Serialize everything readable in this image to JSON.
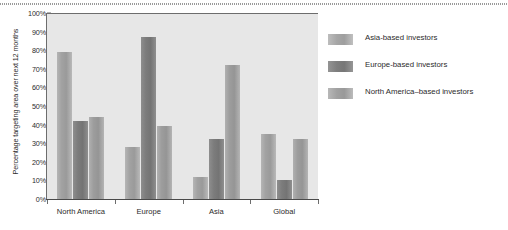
{
  "chart_data": {
    "type": "bar",
    "title": "",
    "subtitle": "",
    "xlabel": "",
    "ylabel": "Percentage targeting area over next 12 months",
    "categories": [
      "North America",
      "Europe",
      "Asia",
      "Global"
    ],
    "series": [
      {
        "name": "Asia-based investors",
        "color": "#a2a2a2",
        "values": [
          79,
          28,
          12,
          35
        ]
      },
      {
        "name": "Europe-based investors",
        "color": "#7c7c7c",
        "values": [
          42,
          87,
          32,
          10
        ]
      },
      {
        "name": "North America–based investors",
        "color": "#9d9d9d",
        "values": [
          44,
          39,
          72,
          32
        ]
      }
    ],
    "ylim": [
      0,
      100
    ],
    "ytick_labels": [
      "0%",
      "10%",
      "20%",
      "30%",
      "40%",
      "50%",
      "60%",
      "70%",
      "80%",
      "90%",
      "100%"
    ],
    "ytick_values": [
      0,
      10,
      20,
      30,
      40,
      50,
      60,
      70,
      80,
      90,
      100
    ],
    "grid": false,
    "legend_position": "right",
    "plot_background": "#e7e7e7"
  },
  "legend": {
    "entries": [
      {
        "label": "Asia-based investors"
      },
      {
        "label": "Europe-based investors"
      },
      {
        "label": "North America–based investors"
      }
    ]
  }
}
